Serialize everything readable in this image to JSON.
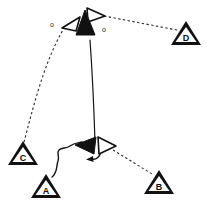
{
  "figure": {
    "title": "",
    "width": 207,
    "height": 204,
    "background_color": "#ffffff",
    "stroke_color": "#111111"
  },
  "nodes": [
    {
      "id": "A",
      "label": "A",
      "x": 46,
      "y": 186,
      "size": 26
    },
    {
      "id": "B",
      "label": "B",
      "x": 159,
      "y": 182,
      "size": 26
    },
    {
      "id": "C",
      "label": "C",
      "x": 23,
      "y": 154,
      "size": 26
    },
    {
      "id": "D",
      "label": "D",
      "x": 186,
      "y": 33,
      "size": 26
    }
  ],
  "agents": [
    {
      "id": "top-filled",
      "style": "filled",
      "heading": "up",
      "x": 85,
      "y": 27
    },
    {
      "id": "top-left-hollow",
      "style": "hollow",
      "heading": "down-left",
      "x": 70,
      "y": 20
    },
    {
      "id": "top-right-hollow",
      "style": "hollow",
      "heading": "right",
      "x": 96,
      "y": 14
    },
    {
      "id": "center-filled",
      "style": "filled",
      "heading": "left",
      "x": 87,
      "y": 146
    },
    {
      "id": "center-hollow",
      "style": "hollow",
      "heading": "right",
      "x": 105,
      "y": 146
    }
  ],
  "edges": [
    {
      "id": "edge-center-to-top",
      "style": "solid",
      "from": "center-filled",
      "to": "top-filled",
      "arrow": true,
      "label": ""
    },
    {
      "id": "edge-C-to-top-left",
      "style": "dashed",
      "from": "C",
      "to": "top-left-hollow",
      "arrow": false,
      "label": "o"
    },
    {
      "id": "edge-top-right-to-D",
      "style": "dashed",
      "from": "top-right-hollow",
      "to": "D",
      "arrow": false,
      "label": "o"
    },
    {
      "id": "edge-center-hollow-to-B",
      "style": "dashed",
      "from": "center-hollow",
      "to": "B",
      "arrow": false,
      "label": ""
    },
    {
      "id": "edge-A-to-center",
      "style": "wavy",
      "from": "A",
      "to": "center-filled",
      "arrow": true,
      "label": ""
    }
  ],
  "edge_labels": [
    {
      "id": "label-left-o",
      "text": "o",
      "x": 52,
      "y": 24
    },
    {
      "id": "label-right-o",
      "text": "o",
      "x": 104,
      "y": 29
    }
  ],
  "annotations": [
    {
      "id": "center-curl-arrow",
      "description": "small curved arrow under center cluster pointing left"
    }
  ]
}
